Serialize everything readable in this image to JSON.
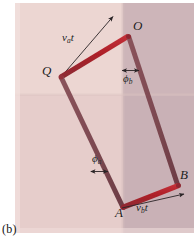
{
  "figure": {
    "caption": "(b)",
    "background": {
      "light_pink": "#e7cfcd",
      "dark_pink": "#ccb5b8",
      "upper_light": "#e9d3d0",
      "white": "#ffffff",
      "region_left_px": 15,
      "region_top_px": 3,
      "region_right_px": 194,
      "region_bottom_px": 233,
      "vertical_split_x_px": 123,
      "horizontal_split_y_px": 95
    },
    "colors": {
      "rod_bright": "#ad1f28",
      "rod_dark": "#7e4a52",
      "annotation_line": "#2a2426",
      "label_text": "#1b1b1b"
    },
    "vertices": [
      {
        "name": "O",
        "label": "O",
        "x": 128,
        "y": 36,
        "label_x": 133,
        "label_y": 26
      },
      {
        "name": "Q",
        "label": "Q",
        "x": 61,
        "y": 77,
        "label_x": 43,
        "label_y": 72
      },
      {
        "name": "A",
        "label": "A",
        "x": 123,
        "y": 207,
        "label_x": 116,
        "label_y": 211
      },
      {
        "name": "B",
        "label": "B",
        "x": 178,
        "y": 185,
        "label_x": 180,
        "label_y": 176
      }
    ],
    "rods": [
      {
        "name": "rod-QO",
        "from": "Q",
        "to": "O",
        "style": "bright"
      },
      {
        "name": "rod-OB",
        "from": "O",
        "to": "B",
        "style": "dark"
      },
      {
        "name": "rod-QA",
        "from": "Q",
        "to": "A",
        "style": "dark"
      },
      {
        "name": "rod-AB",
        "from": "A",
        "to": "B",
        "style": "bright"
      }
    ],
    "annotations": [
      {
        "name": "va-t-displacement",
        "label": "v",
        "subscript": "a",
        "trailing": "t",
        "text": "vₐt",
        "label_x": 63,
        "label_y": 38,
        "arrow_from": {
          "x": 61,
          "y": 77
        },
        "arrow_to": {
          "x": 113,
          "y": 16
        }
      },
      {
        "name": "vb-t-displacement",
        "label": "v",
        "subscript": "b",
        "trailing": "t",
        "text": "v_b t",
        "label_x": 136,
        "label_y": 208,
        "arrow_from": {
          "x": 123,
          "y": 207
        },
        "arrow_to": {
          "x": 184,
          "y": 193
        }
      },
      {
        "name": "phi-b-angle",
        "label": "ϕ",
        "subscript": "b",
        "text": "ϕ_b",
        "label_x": 124,
        "label_y": 78,
        "bar_from": {
          "x": 122,
          "y": 71
        },
        "bar_to": {
          "x": 139,
          "y": 71
        }
      },
      {
        "name": "phi-a-angle",
        "label": "ϕ",
        "subscript": "a",
        "text": "ϕ_a",
        "label_x": 93,
        "label_y": 158,
        "bar_from": {
          "x": 91,
          "y": 172
        },
        "bar_to": {
          "x": 108,
          "y": 172
        }
      }
    ]
  }
}
